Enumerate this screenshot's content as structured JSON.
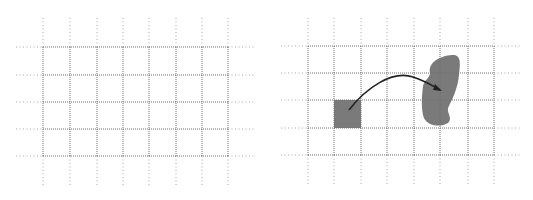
{
  "diagram": {
    "colors": {
      "grid_line": "#6f6f6f",
      "grid_ext": "#a8a8a8",
      "fill": "#7a7a7a",
      "arrow": "#222222",
      "background": "#ffffff"
    },
    "panels": [
      {
        "id": "left",
        "cols_x": [
          43,
          70,
          97,
          123,
          149,
          176,
          202,
          228
        ],
        "rows_y": [
          47,
          75,
          102,
          129,
          156
        ],
        "ext_top": 18,
        "ext_bottom": 185,
        "ext_left": 16,
        "ext_right": 256
      },
      {
        "id": "right",
        "cols_x": [
          308,
          334,
          361,
          387,
          414,
          440,
          468,
          494
        ],
        "rows_y": [
          46,
          73,
          100,
          128,
          155
        ],
        "ext_top": 18,
        "ext_bottom": 184,
        "ext_left": 281,
        "ext_right": 522,
        "square": {
          "x": 334,
          "y": 100,
          "w": 27,
          "h": 28
        },
        "blob_path": "M430 73 C428 62 440 56 452 55 C462 54 460 65 459 75 C458 88 452 100 448 108 C447 114 453 118 448 123 C440 128 425 126 423 115 C421 104 422 95 423 86 C424 80 430 78 430 73 Z",
        "arrow_path": "M349 110 C366 88 392 70 413 77 C425 81 432 85 440 90"
      }
    ]
  }
}
